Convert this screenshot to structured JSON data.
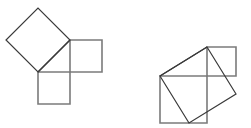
{
  "canvas": {
    "width": 251,
    "height": 128,
    "background": "#ffffff"
  },
  "style": {
    "leg_square_color": "#7b7b7b",
    "leg_square_width": 1.6,
    "hyp_square_color": "#3a3a3a",
    "hyp_square_width": 1.2,
    "hypotenuse_color": "#3a3a3a",
    "hypotenuse_width": 1.2
  },
  "figures": [
    {
      "name": "pythagorean-figure-left",
      "label": "Isosceles right triangle with squares on all three sides",
      "triangle": {
        "right_angle_vertex": [
          70,
          72
        ],
        "vertex_a": [
          38,
          72
        ],
        "vertex_b": [
          70,
          40
        ],
        "leg_horizontal_length": 32,
        "leg_vertical_length": 32,
        "hypotenuse_length": 45.25,
        "hypotenuse_angle_deg": 45
      },
      "squares": {
        "bottom_square": {
          "name": "square-on-horizontal-leg",
          "points": "38,72 70,72 70,104 38,104"
        },
        "right_square": {
          "name": "square-on-vertical-leg",
          "points": "70,40 102,40 102,72 70,72"
        },
        "hypotenuse_square": {
          "name": "square-on-hypotenuse",
          "points": "38,72 70,40 38,8 6,40"
        }
      }
    },
    {
      "name": "pythagorean-figure-right",
      "label": "Scalene right triangle with squares on all three sides",
      "triangle": {
        "right_angle_vertex": [
          207,
          76
        ],
        "vertex_a": [
          160,
          76
        ],
        "vertex_b": [
          207,
          47
        ],
        "leg_horizontal_length": 47,
        "leg_vertical_length": 29,
        "hypotenuse_length": 55.23,
        "hypotenuse_angle_deg": 31.67
      },
      "squares": {
        "bottom_square": {
          "name": "square-on-horizontal-leg",
          "points": "160,76 207,76 207,123 160,123"
        },
        "right_square": {
          "name": "square-on-vertical-leg",
          "points": "207,47 236,47 236,76 207,76"
        },
        "hypotenuse_square": {
          "name": "square-on-hypotenuse",
          "points": "160,76 207,47 236,94 189,123"
        }
      }
    }
  ]
}
